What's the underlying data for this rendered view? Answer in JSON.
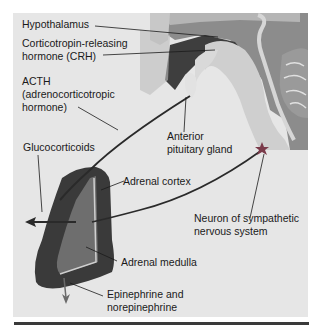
{
  "diagram": {
    "type": "anatomy-illustration",
    "colors": {
      "background": "#ffffff",
      "panel": "#e6e6e6",
      "text": "#1a1a1a",
      "pathway_line": "#2a2a2a",
      "adrenal_cortex": "#3a3a3a",
      "adrenal_medulla": "#6a6a6a",
      "bottom_rule": "#3a3a3a"
    },
    "labels": {
      "hypothalamus": "Hypothalamus",
      "crh_line1": "Corticotropin-releasing",
      "crh_line2": "hormone (CRH)",
      "acth_line1": "ACTH",
      "acth_line2": "(adrenocorticotropic",
      "acth_line3": "hormone)",
      "anterior_pituitary_line1": "Anterior",
      "anterior_pituitary_line2": "pituitary gland",
      "glucocorticoids": "Glucocorticoids",
      "adrenal_cortex": "Adrenal cortex",
      "neuron_line1": "Neuron of sympathetic",
      "neuron_line2": "nervous system",
      "adrenal_medulla": "Adrenal medulla",
      "epinephrine_line1": "Epinephrine and",
      "epinephrine_line2": "norepinephrine"
    },
    "icons": {
      "neuron_marker": "star-icon",
      "output_arrow": "arrow-left-icon",
      "secretion_arrow": "arrow-down-icon"
    }
  }
}
